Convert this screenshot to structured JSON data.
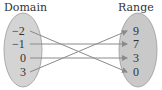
{
  "diagram": {
    "type": "mapping",
    "domain": {
      "title": "Domain",
      "values": [
        "−2",
        "−1",
        "0",
        "3"
      ]
    },
    "range": {
      "title": "Range",
      "values": [
        "9",
        "7",
        "3",
        "0"
      ]
    },
    "mappings": [
      {
        "from": "−2",
        "to": "0"
      },
      {
        "from": "−1",
        "to": "7"
      },
      {
        "from": "0",
        "to": "3"
      },
      {
        "from": "3",
        "to": "9"
      }
    ],
    "colors": {
      "oval_fill": "#d4d4d4",
      "oval_stroke": "#9a9a9a",
      "arrow": "#8a8a8a",
      "text": "#333333"
    }
  }
}
